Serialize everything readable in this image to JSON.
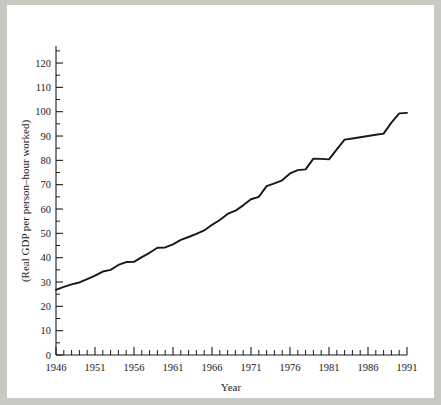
{
  "figure": {
    "background_color": "#ffffff",
    "page_color": "#c9c9c4",
    "line_color": "#17171c",
    "axis_color": "#1a1a1a"
  },
  "chart_data": {
    "type": "line",
    "title": "",
    "xlabel": "Year",
    "ylabel": "(Real GDP per person–hour worked)",
    "xlim": [
      1946,
      1991
    ],
    "ylim": [
      0,
      127
    ],
    "grid": false,
    "legend": null,
    "x_major_ticks": [
      1946,
      1951,
      1956,
      1961,
      1966,
      1971,
      1976,
      1981,
      1986,
      1991
    ],
    "x_major_tick_labels": [
      "1946",
      "1951",
      "1956",
      "1961",
      "1966",
      "1971",
      "1976",
      "1981",
      "1986",
      "1991"
    ],
    "x_minor_tick_interval": 1,
    "y_major_ticks": [
      0,
      10,
      20,
      30,
      40,
      50,
      60,
      70,
      80,
      90,
      100,
      110,
      120
    ],
    "y_major_tick_labels": [
      "0",
      "10",
      "20",
      "30",
      "40",
      "50",
      "60",
      "70",
      "80",
      "90",
      "100",
      "110",
      "120"
    ],
    "y_minor_tick_interval": 5,
    "series": [
      {
        "name": "Real GDP per person-hour worked",
        "x": [
          1946,
          1947,
          1948,
          1949,
          1950,
          1951,
          1952,
          1953,
          1954,
          1955,
          1956,
          1957,
          1958,
          1959,
          1960,
          1961,
          1962,
          1963,
          1964,
          1965,
          1966,
          1967,
          1968,
          1969,
          1970,
          1971,
          1972,
          1973,
          1974,
          1975,
          1976,
          1977,
          1978,
          1979,
          1980,
          1981,
          1982,
          1983,
          1984,
          1985,
          1986,
          1987,
          1988,
          1989,
          1990,
          1991
        ],
        "values": [
          26.8,
          28.0,
          29.0,
          29.8,
          31.2,
          32.6,
          34.3,
          35.0,
          37.0,
          38.2,
          38.3,
          40.2,
          42.0,
          44.1,
          44.2,
          45.5,
          47.3,
          48.5,
          49.8,
          51.2,
          53.5,
          55.5,
          58.0,
          59.3,
          61.5,
          64.0,
          65.0,
          69.4,
          70.5,
          71.8,
          74.6,
          76.0,
          76.3,
          80.7,
          80.6,
          80.4,
          84.5,
          88.5,
          89.0,
          89.5,
          90.0,
          90.5,
          91.0,
          95.5,
          99.3,
          99.5
        ]
      }
    ]
  }
}
